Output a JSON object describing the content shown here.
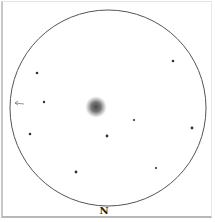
{
  "sketch": {
    "type": "eyepiece-sketch",
    "field": {
      "cx": 108,
      "cy": 108,
      "r": 98,
      "stroke": "#555555"
    },
    "direction_label": "N",
    "object": {
      "name": "nebula",
      "cx": 96,
      "cy": 107,
      "r": 11,
      "color": "#4a4a4a"
    },
    "arrow": {
      "x1": 24,
      "y1": 104,
      "x2": 15,
      "y2": 103,
      "color": "#777777"
    },
    "stars": [
      {
        "x": 173,
        "y": 61,
        "r": 1.3
      },
      {
        "x": 37,
        "y": 73,
        "r": 1.3
      },
      {
        "x": 44,
        "y": 102,
        "r": 1.2
      },
      {
        "x": 30,
        "y": 134,
        "r": 1.3
      },
      {
        "x": 134,
        "y": 120,
        "r": 1.1
      },
      {
        "x": 192,
        "y": 128,
        "r": 1.4
      },
      {
        "x": 107,
        "y": 136,
        "r": 1.4
      },
      {
        "x": 76,
        "y": 172,
        "r": 1.4
      },
      {
        "x": 156,
        "y": 168,
        "r": 1.1
      }
    ]
  }
}
